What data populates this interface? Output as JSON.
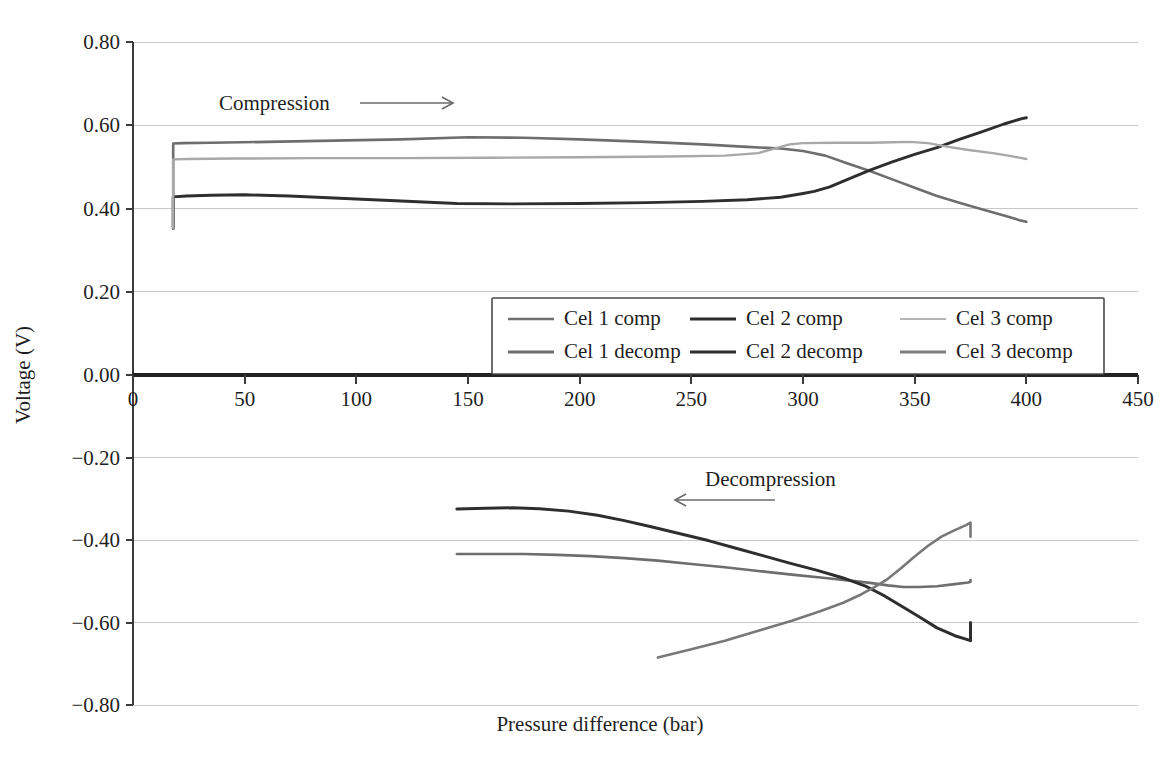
{
  "chart_data": {
    "type": "line",
    "title": "",
    "xlabel": "Pressure difference (bar)",
    "ylabel": "Voltage (V)",
    "xlim": [
      0,
      450
    ],
    "ylim": [
      -0.8,
      0.8
    ],
    "xticks": [
      0,
      50,
      100,
      150,
      200,
      250,
      300,
      350,
      400,
      450
    ],
    "xtick_labels": [
      "0",
      "50",
      "100",
      "150",
      "200",
      "250",
      "300",
      "350",
      "400",
      "450"
    ],
    "yticks": [
      0.8,
      0.6,
      0.4,
      0.2,
      0.0,
      -0.2,
      -0.4,
      -0.6,
      -0.8
    ],
    "ytick_labels": [
      "0.80",
      "0.60",
      "0.40",
      "0.20",
      "0.00",
      "−0.20",
      "−0.40",
      "−0.60",
      "−0.80"
    ],
    "grid": true,
    "legend_position": "center",
    "annotations": [
      {
        "text": "Compression",
        "direction": "right",
        "x": 150,
        "y": 0.66
      },
      {
        "text": "Decompression",
        "direction": "left",
        "x": 300,
        "y": -0.24
      }
    ],
    "series": [
      {
        "name": "Cel 1 comp",
        "color": "#6e6e6e",
        "width": 2.6,
        "points": [
          [
            18,
            0.352
          ],
          [
            18,
            0.556
          ],
          [
            22,
            0.557
          ],
          [
            35,
            0.558
          ],
          [
            60,
            0.56
          ],
          [
            90,
            0.563
          ],
          [
            120,
            0.566
          ],
          [
            150,
            0.571
          ],
          [
            175,
            0.57
          ],
          [
            200,
            0.566
          ],
          [
            230,
            0.56
          ],
          [
            255,
            0.554
          ],
          [
            275,
            0.548
          ],
          [
            290,
            0.544
          ],
          [
            300,
            0.538
          ],
          [
            310,
            0.527
          ],
          [
            320,
            0.508
          ],
          [
            330,
            0.49
          ],
          [
            340,
            0.47
          ],
          [
            350,
            0.45
          ],
          [
            360,
            0.43
          ],
          [
            370,
            0.414
          ],
          [
            380,
            0.398
          ],
          [
            390,
            0.383
          ],
          [
            397,
            0.372
          ],
          [
            400,
            0.368
          ]
        ]
      },
      {
        "name": "Cel 2 comp",
        "color": "#2e2e2e",
        "width": 2.9,
        "points": [
          [
            18,
            0.352
          ],
          [
            18,
            0.428
          ],
          [
            24,
            0.43
          ],
          [
            35,
            0.432
          ],
          [
            50,
            0.433
          ],
          [
            70,
            0.43
          ],
          [
            95,
            0.424
          ],
          [
            120,
            0.418
          ],
          [
            145,
            0.412
          ],
          [
            170,
            0.411
          ],
          [
            200,
            0.412
          ],
          [
            230,
            0.414
          ],
          [
            255,
            0.417
          ],
          [
            275,
            0.421
          ],
          [
            290,
            0.427
          ],
          [
            300,
            0.436
          ],
          [
            305,
            0.441
          ],
          [
            312,
            0.452
          ],
          [
            320,
            0.47
          ],
          [
            330,
            0.492
          ],
          [
            340,
            0.512
          ],
          [
            350,
            0.53
          ],
          [
            360,
            0.546
          ],
          [
            370,
            0.566
          ],
          [
            380,
            0.584
          ],
          [
            390,
            0.603
          ],
          [
            398,
            0.616
          ],
          [
            400,
            0.618
          ]
        ]
      },
      {
        "name": "Cel 3 comp",
        "color": "#a8a8a8",
        "width": 2.4,
        "points": [
          [
            18,
            0.352
          ],
          [
            18,
            0.518
          ],
          [
            25,
            0.519
          ],
          [
            45,
            0.52
          ],
          [
            80,
            0.521
          ],
          [
            120,
            0.521
          ],
          [
            160,
            0.522
          ],
          [
            200,
            0.523
          ],
          [
            240,
            0.525
          ],
          [
            265,
            0.527
          ],
          [
            280,
            0.533
          ],
          [
            288,
            0.545
          ],
          [
            294,
            0.554
          ],
          [
            300,
            0.557
          ],
          [
            315,
            0.558
          ],
          [
            330,
            0.558
          ],
          [
            340,
            0.559
          ],
          [
            348,
            0.56
          ],
          [
            356,
            0.557
          ],
          [
            365,
            0.548
          ],
          [
            375,
            0.54
          ],
          [
            385,
            0.533
          ],
          [
            392,
            0.527
          ],
          [
            398,
            0.521
          ],
          [
            400,
            0.519
          ]
        ]
      },
      {
        "name": "Cel 1 decomp",
        "color": "#6e6e6e",
        "width": 2.6,
        "points": [
          [
            145,
            -0.434
          ],
          [
            160,
            -0.434
          ],
          [
            175,
            -0.434
          ],
          [
            190,
            -0.436
          ],
          [
            205,
            -0.439
          ],
          [
            220,
            -0.444
          ],
          [
            235,
            -0.45
          ],
          [
            250,
            -0.458
          ],
          [
            265,
            -0.466
          ],
          [
            280,
            -0.475
          ],
          [
            295,
            -0.484
          ],
          [
            310,
            -0.492
          ],
          [
            322,
            -0.499
          ],
          [
            330,
            -0.504
          ],
          [
            338,
            -0.51
          ],
          [
            345,
            -0.514
          ],
          [
            352,
            -0.514
          ],
          [
            360,
            -0.512
          ],
          [
            368,
            -0.507
          ],
          [
            374,
            -0.503
          ],
          [
            375,
            -0.501
          ],
          [
            375,
            -0.497
          ]
        ]
      },
      {
        "name": "Cel 2 decomp",
        "color": "#2e2e2e",
        "width": 3.0,
        "points": [
          [
            145,
            -0.325
          ],
          [
            158,
            -0.323
          ],
          [
            170,
            -0.322
          ],
          [
            182,
            -0.324
          ],
          [
            195,
            -0.33
          ],
          [
            208,
            -0.34
          ],
          [
            220,
            -0.353
          ],
          [
            232,
            -0.368
          ],
          [
            245,
            -0.385
          ],
          [
            258,
            -0.402
          ],
          [
            270,
            -0.42
          ],
          [
            282,
            -0.438
          ],
          [
            294,
            -0.456
          ],
          [
            306,
            -0.473
          ],
          [
            318,
            -0.492
          ],
          [
            328,
            -0.512
          ],
          [
            336,
            -0.534
          ],
          [
            344,
            -0.56
          ],
          [
            352,
            -0.586
          ],
          [
            360,
            -0.613
          ],
          [
            368,
            -0.632
          ],
          [
            374,
            -0.642
          ],
          [
            375,
            -0.644
          ],
          [
            375,
            -0.6
          ]
        ]
      },
      {
        "name": "Cel 3 decomp",
        "color": "#787878",
        "width": 2.6,
        "points": [
          [
            235,
            -0.685
          ],
          [
            250,
            -0.665
          ],
          [
            265,
            -0.644
          ],
          [
            280,
            -0.62
          ],
          [
            295,
            -0.596
          ],
          [
            308,
            -0.572
          ],
          [
            318,
            -0.552
          ],
          [
            326,
            -0.532
          ],
          [
            332,
            -0.514
          ],
          [
            338,
            -0.494
          ],
          [
            344,
            -0.468
          ],
          [
            350,
            -0.44
          ],
          [
            356,
            -0.414
          ],
          [
            362,
            -0.392
          ],
          [
            368,
            -0.376
          ],
          [
            373,
            -0.364
          ],
          [
            375,
            -0.358
          ],
          [
            375,
            -0.392
          ]
        ]
      }
    ]
  },
  "legend": {
    "items": [
      {
        "label": "Cel 1 comp",
        "color": "#6e6e6e",
        "width": 2.6
      },
      {
        "label": "Cel 2 comp",
        "color": "#2e2e2e",
        "width": 3.2
      },
      {
        "label": "Cel 3 comp",
        "color": "#b5b5b5",
        "width": 2.2
      },
      {
        "label": "Cel 1 decomp",
        "color": "#6e6e6e",
        "width": 2.8
      },
      {
        "label": "Cel 2 decomp",
        "color": "#2e2e2e",
        "width": 3.2
      },
      {
        "label": "Cel 3 decomp",
        "color": "#7d7d7d",
        "width": 2.8
      }
    ]
  }
}
